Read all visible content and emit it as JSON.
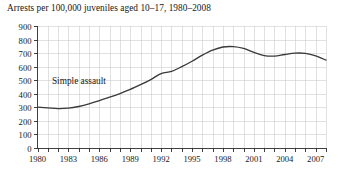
{
  "chart_data": {
    "type": "line",
    "title": "Arrests per 100,000 juveniles aged 10–17, 1980–2008",
    "xlabel": "",
    "ylabel": "",
    "xlim": [
      1980,
      2008
    ],
    "ylim": [
      0,
      900
    ],
    "grid": true,
    "legend_position": "inline-annotation",
    "y_ticks": [
      0,
      100,
      200,
      300,
      400,
      500,
      600,
      700,
      800,
      900
    ],
    "y_tick_labels": [
      "0",
      "100",
      "200",
      "300",
      "400",
      "500",
      "600",
      "700",
      "800",
      "900"
    ],
    "x_minor_ticks": [
      1980,
      1981,
      1982,
      1983,
      1984,
      1985,
      1986,
      1987,
      1988,
      1989,
      1990,
      1991,
      1992,
      1993,
      1994,
      1995,
      1996,
      1997,
      1998,
      1999,
      2000,
      2001,
      2002,
      2003,
      2004,
      2005,
      2006,
      2007,
      2008
    ],
    "x_tick_labels": [
      "1980",
      "1983",
      "1986",
      "1989",
      "1992",
      "1995",
      "1998",
      "2001",
      "2004",
      "2007"
    ],
    "x_tick_label_years": [
      1980,
      1983,
      1986,
      1989,
      1992,
      1995,
      1998,
      2001,
      2004,
      2007
    ],
    "annotations": [
      {
        "text": "Simple assault",
        "x": 1981.4,
        "y": 475
      }
    ],
    "series": [
      {
        "name": "Simple assault",
        "color": "#3a3a3a",
        "x": [
          1980,
          1981,
          1982,
          1983,
          1984,
          1985,
          1986,
          1987,
          1988,
          1989,
          1990,
          1991,
          1992,
          1993,
          1994,
          1995,
          1996,
          1997,
          1998,
          1999,
          2000,
          2001,
          2002,
          2003,
          2004,
          2005,
          2006,
          2007,
          2008
        ],
        "values": [
          302,
          296,
          291,
          294,
          306,
          325,
          350,
          375,
          402,
          432,
          467,
          505,
          548,
          565,
          600,
          640,
          685,
          722,
          745,
          748,
          735,
          705,
          682,
          678,
          690,
          700,
          698,
          680,
          648
        ]
      }
    ]
  },
  "colors": {
    "line": "#3a3a3a",
    "grid": "#c9c9c9",
    "axis": "#2b2b2b",
    "text": "#171717",
    "background": "#ffffff"
  }
}
